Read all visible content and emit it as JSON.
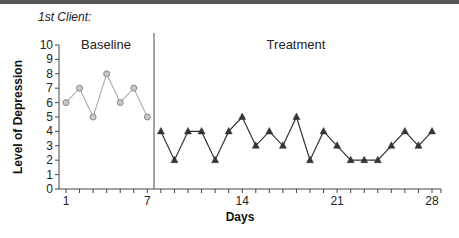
{
  "header": {
    "client_label": "1st Client:"
  },
  "chart_data": {
    "type": "line",
    "title": "1st Client:",
    "xlabel": "Days",
    "ylabel": "Level of Depression",
    "ylim": [
      0,
      10
    ],
    "xlim": [
      1,
      28
    ],
    "x_tick_labels": [
      "1",
      "7",
      "14",
      "21",
      "28"
    ],
    "y_tick_labels": [
      "0",
      "1",
      "2",
      "3",
      "4",
      "5",
      "6",
      "7",
      "8",
      "9",
      "10"
    ],
    "grid": false,
    "phase_line_after_day": 7.5,
    "phases": [
      {
        "name": "Baseline",
        "marker": "circle",
        "color": "#999999"
      },
      {
        "name": "Treatment",
        "marker": "triangle",
        "color": "#333333"
      }
    ],
    "series": [
      {
        "name": "Baseline",
        "x": [
          1,
          2,
          3,
          4,
          5,
          6,
          7
        ],
        "values": [
          6,
          7,
          5,
          8,
          6,
          7,
          5
        ]
      },
      {
        "name": "Treatment",
        "x": [
          8,
          9,
          10,
          11,
          12,
          13,
          14,
          15,
          16,
          17,
          18,
          19,
          20,
          21,
          22,
          23,
          24,
          25,
          26,
          27,
          28
        ],
        "values": [
          4,
          2,
          4,
          4,
          2,
          4,
          5,
          3,
          4,
          3,
          5,
          2,
          4,
          3,
          2,
          2,
          2,
          3,
          4,
          3,
          4
        ]
      }
    ]
  }
}
